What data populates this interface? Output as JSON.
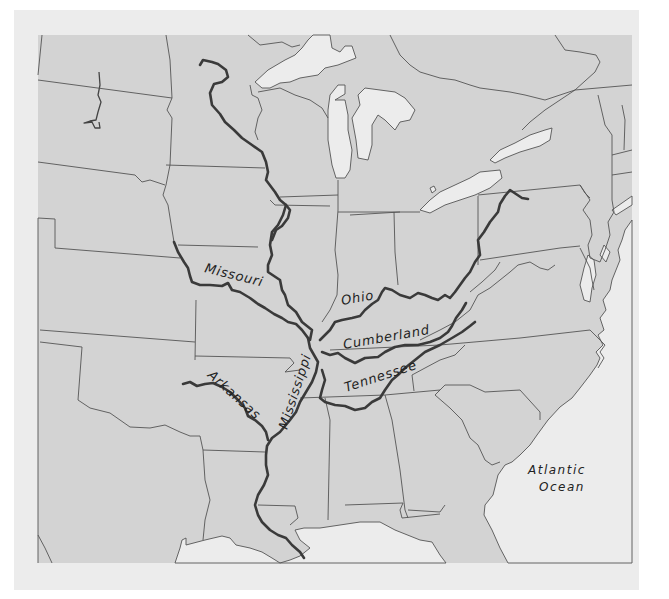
{
  "map": {
    "title": "Mississippi River system",
    "colors": {
      "land": "#d3d3d3",
      "water": "#ececec",
      "river": "#3a3a3a",
      "border": "#555555",
      "frame": "#ececec"
    },
    "rivers": [
      {
        "name": "Missouri",
        "label": "Missouri"
      },
      {
        "name": "Ohio",
        "label": "Ohio"
      },
      {
        "name": "Cumberland",
        "label": "Cumberland"
      },
      {
        "name": "Tennessee",
        "label": "Tennessee"
      },
      {
        "name": "Arkansas",
        "label": "Arkansas"
      },
      {
        "name": "Mississippi",
        "label": "Mississippi"
      }
    ],
    "water_bodies": [
      {
        "name": "Atlantic Ocean",
        "label_line1": "Atlantic",
        "label_line2": "Ocean"
      }
    ]
  }
}
